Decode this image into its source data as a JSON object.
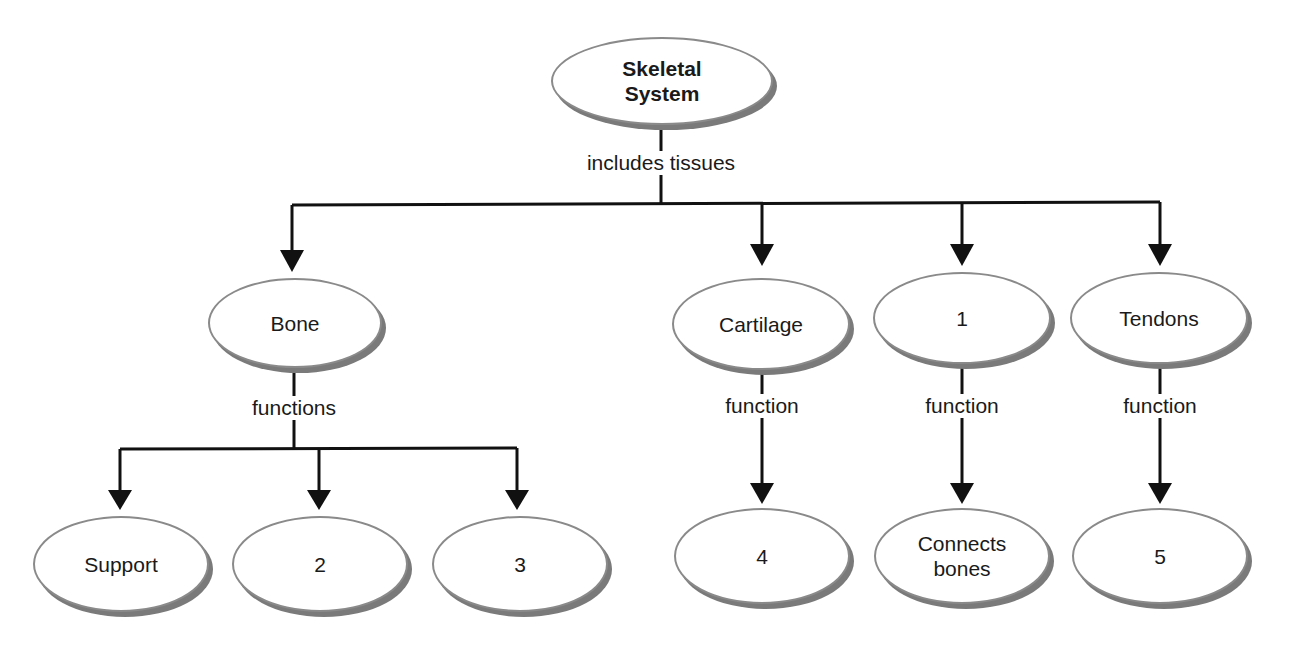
{
  "diagram": {
    "type": "concept-map",
    "root": {
      "label": "Skeletal System"
    },
    "root_link_label": "includes tissues",
    "tissues": [
      {
        "label": "Bone",
        "link_label": "functions",
        "children": [
          "Support",
          "2",
          "3"
        ]
      },
      {
        "label": "Cartilage",
        "link_label": "function",
        "children": [
          "4"
        ]
      },
      {
        "label": "1",
        "link_label": "function",
        "children": [
          "Connects bones"
        ]
      },
      {
        "label": "Tendons",
        "link_label": "function",
        "children": [
          "5"
        ]
      }
    ]
  },
  "nodes": {
    "root": "Skeletal System",
    "bone": "Bone",
    "cartilage": "Cartilage",
    "blank1": "1",
    "tendons": "Tendons",
    "support": "Support",
    "blank2": "2",
    "blank3": "3",
    "blank4": "4",
    "connects": "Connects bones",
    "blank5": "5"
  },
  "links": {
    "includes": "includes tissues",
    "bone_functions": "functions",
    "cartilage_function": "function",
    "blank1_function": "function",
    "tendons_function": "function"
  },
  "colors": {
    "line": "#111111",
    "node_border": "#8a8a8a",
    "node_shadow": "#7a7a7a"
  }
}
